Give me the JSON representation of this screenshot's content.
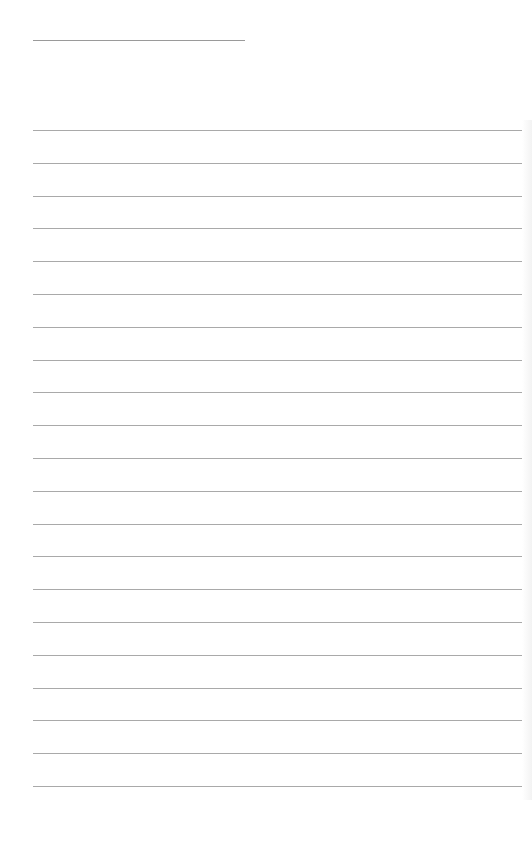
{
  "page": {
    "type": "lined-notepaper",
    "background_color": "#ffffff",
    "line_color": "#a9a9a9"
  },
  "header_rule": {
    "x": 33,
    "y": 40,
    "width": 212
  },
  "ruled_lines": {
    "count": 21,
    "start_y": 130,
    "spacing": 32.8,
    "x": 33,
    "width": 489
  }
}
